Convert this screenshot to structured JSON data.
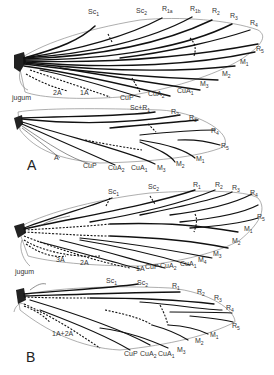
{
  "figure": {
    "panels": [
      {
        "id": "A",
        "panel_label": "A",
        "forewing": {
          "labels": [
            "Sc1",
            "Sc2",
            "R1a",
            "R1b",
            "R2",
            "R3",
            "R4",
            "R5",
            "M1",
            "M2",
            "M3",
            "CuA1",
            "CuA2",
            "CuP",
            "1A",
            "2A",
            "jugum"
          ]
        },
        "hindwing": {
          "labels": [
            "Sc+R1",
            "R2",
            "R3",
            "R4",
            "R5",
            "M1",
            "M2",
            "M3",
            "CuA1",
            "CuA2",
            "CuP",
            "A"
          ]
        }
      },
      {
        "id": "B",
        "panel_label": "B",
        "forewing": {
          "labels": [
            "Sc1",
            "Sc2",
            "R1",
            "R2",
            "R3",
            "R4",
            "R5",
            "M1",
            "M2",
            "M3",
            "M4",
            "CuA1",
            "CuA2",
            "CuP",
            "1A",
            "2A",
            "3A",
            "jugum"
          ]
        },
        "hindwing": {
          "labels": [
            "Sc1",
            "Sc2",
            "R1",
            "R2",
            "R3",
            "R4",
            "R5",
            "M1",
            "M2",
            "M3",
            "CuA1",
            "CuA2",
            "CuP",
            "1A+2A"
          ]
        }
      }
    ]
  },
  "labels": {
    "A": {
      "fw": {
        "sc1": "Sc",
        "sc1s": "1",
        "sc2": "Sc",
        "sc2s": "2",
        "r1a": "R",
        "r1as": "1a",
        "r1b": "R",
        "r1bs": "1b",
        "r2": "R",
        "r2s": "2",
        "r3": "R",
        "r3s": "3",
        "r4": "R",
        "r4s": "4",
        "r5": "R",
        "r5s": "5",
        "m1": "M",
        "m1s": "1",
        "m2": "M",
        "m2s": "2",
        "m3": "M",
        "m3s": "3",
        "cua1": "CuA",
        "cua1s": "1",
        "cua2": "CuA",
        "cua2s": "2",
        "cup": "CuP",
        "a1": "1A",
        "a2": "2A",
        "jugum": "jugum"
      },
      "hw": {
        "scr1": "Sc+R",
        "scr1s": "1",
        "r2": "R",
        "r2s": "2",
        "r3": "R",
        "r3s": "3",
        "r4": "R",
        "r4s": "4",
        "r5": "R",
        "r5s": "5",
        "m1": "M",
        "m1s": "1",
        "m2": "M",
        "m2s": "2",
        "m3": "M",
        "m3s": "3",
        "cua1": "CuA",
        "cua1s": "1",
        "cua2": "CuA",
        "cua2s": "2",
        "cup": "CuP",
        "a": "A"
      },
      "panel": "A"
    },
    "B": {
      "fw": {
        "sc1": "Sc",
        "sc1s": "1",
        "sc2": "Sc",
        "sc2s": "2",
        "r1": "R",
        "r1s": "1",
        "r2": "R",
        "r2s": "2",
        "r3": "R",
        "r3s": "3",
        "r4": "R",
        "r4s": "4",
        "r5": "R",
        "r5s": "5",
        "m1": "M",
        "m1s": "1",
        "m2": "M",
        "m2s": "2",
        "m3": "M",
        "m3s": "3",
        "m4": "M",
        "m4s": "4",
        "cua1": "CuA",
        "cua1s": "1",
        "cua2": "CuA",
        "cua2s": "2",
        "cup": "CuP",
        "a1": "1A",
        "a2": "2A",
        "a3": "3A",
        "jugum": "jugum"
      },
      "hw": {
        "sc1": "Sc",
        "sc1s": "1",
        "sc2": "Sc",
        "sc2s": "2",
        "r1": "R",
        "r1s": "1",
        "r2": "R",
        "r2s": "2",
        "r3": "R",
        "r3s": "3",
        "r4": "R",
        "r4s": "4",
        "r5": "R",
        "r5s": "5",
        "m1": "M",
        "m1s": "1",
        "m2": "M",
        "m2s": "2",
        "m3": "M",
        "m3s": "3",
        "cua1": "CuA",
        "cua1s": "1",
        "cua2": "CuA",
        "cua2s": "2",
        "cup": "CuP",
        "a12": "1A+2A"
      },
      "panel": "B"
    }
  }
}
